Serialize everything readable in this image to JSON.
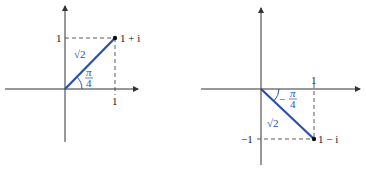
{
  "colors": {
    "vector": "#2a4fb0",
    "axis": "#333333",
    "text": "#222222"
  },
  "diagrams": [
    {
      "name": "left",
      "point_label": "1 + i",
      "magnitude_label": "√2",
      "angle_num": "π",
      "angle_den": "4",
      "x_tick": "1",
      "y_tick": "1"
    },
    {
      "name": "right",
      "point_label": "1 − i",
      "magnitude_label": "√2",
      "angle_sign": "−",
      "angle_num": "π",
      "angle_den": "4",
      "x_tick": "1",
      "y_tick": "−1"
    }
  ]
}
